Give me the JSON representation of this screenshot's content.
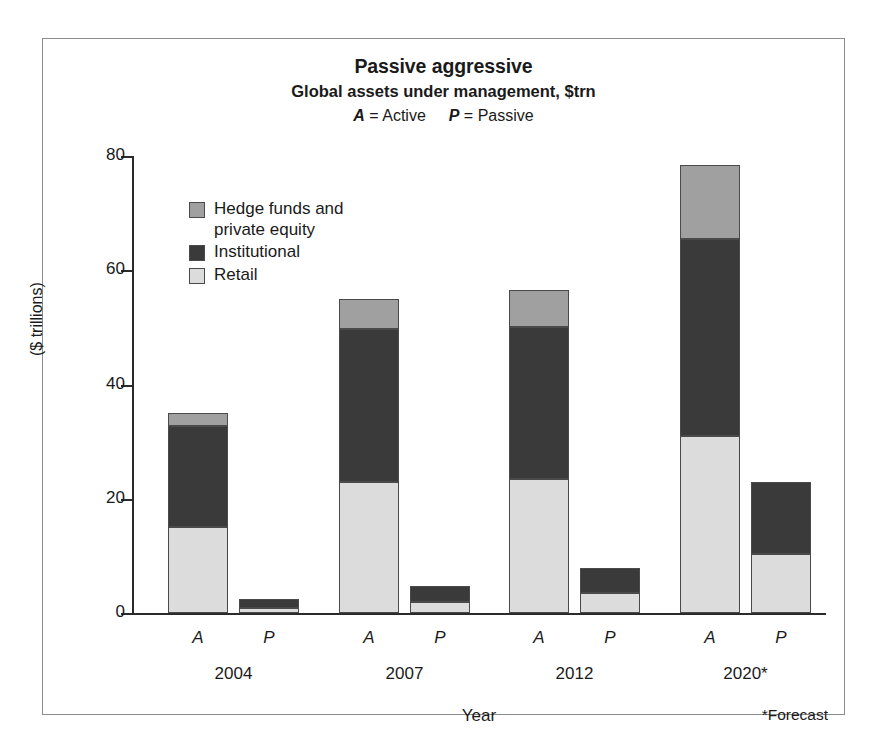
{
  "chart_data": {
    "type": "bar",
    "stacked": true,
    "title": "Passive aggressive",
    "subtitle": "Global assets under management, $trn",
    "key_note": {
      "active_letter": "A",
      "active_word": "= Active",
      "passive_letter": "P",
      "passive_word": "= Passive"
    },
    "xlabel": "Year",
    "ylabel": "($ trillions)",
    "ylim": [
      0,
      80
    ],
    "yticks": [
      0,
      20,
      40,
      60,
      80
    ],
    "ytick_labels": [
      "0",
      "20",
      "40",
      "60",
      "80"
    ],
    "grid": false,
    "legend_position": "inside-top-left",
    "footnote": "*Forecast",
    "groups": [
      "2004",
      "2007",
      "2012",
      "2020*"
    ],
    "subcategories": [
      "A",
      "P"
    ],
    "categories": [
      "2004 A",
      "2004 P",
      "2007 A",
      "2007 P",
      "2012 A",
      "2012 P",
      "2020* A",
      "2020* P"
    ],
    "series": [
      {
        "name": "Retail",
        "color": "#dcdcdc",
        "values": [
          15.0,
          0.8,
          23.0,
          2.0,
          23.5,
          3.5,
          31.0,
          10.3
        ]
      },
      {
        "name": "Institutional",
        "color": "#3a3a3a",
        "values": [
          17.7,
          1.7,
          26.7,
          2.7,
          26.5,
          4.3,
          34.5,
          12.7
        ]
      },
      {
        "name": "Hedge funds and private equity",
        "color": "#a0a0a0",
        "values": [
          2.3,
          0.0,
          5.2,
          0.0,
          6.5,
          0.0,
          13.0,
          0.0
        ]
      }
    ],
    "totals": [
      35.0,
      2.5,
      54.9,
      4.7,
      56.5,
      7.8,
      78.5,
      23.0
    ],
    "cumulative_tops": {
      "retail": [
        15.0,
        0.8,
        23.0,
        2.0,
        23.5,
        3.5,
        31.0,
        10.3
      ],
      "institutional": [
        32.7,
        2.5,
        49.7,
        4.7,
        50.0,
        7.8,
        65.5,
        23.0
      ],
      "hedge": [
        35.0,
        2.5,
        54.9,
        4.7,
        56.5,
        7.8,
        78.5,
        23.0
      ]
    }
  },
  "legend": {
    "items": [
      {
        "label": "Hedge funds and\nprivate equity",
        "color": "#a0a0a0"
      },
      {
        "label": "Institutional",
        "color": "#3a3a3a"
      },
      {
        "label": "Retail",
        "color": "#dcdcdc"
      }
    ]
  },
  "axis_labels": {
    "ap": [
      "A",
      "P",
      "A",
      "P",
      "A",
      "P",
      "A",
      "P"
    ],
    "years": [
      "2004",
      "2007",
      "2012",
      "2020*"
    ]
  },
  "colors": {
    "retail": "#dcdcdc",
    "institutional": "#3a3a3a",
    "hedge": "#a0a0a0",
    "axis": "#2b2b2b",
    "frame": "#8c8c8c",
    "bar_outline": "#4a4a4a"
  }
}
